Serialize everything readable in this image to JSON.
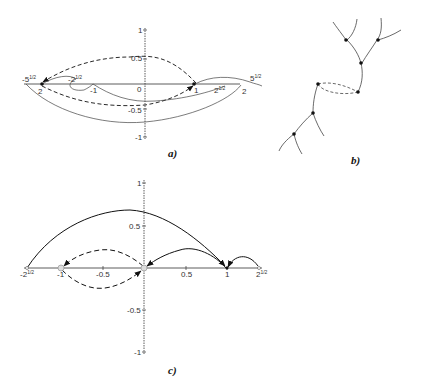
{
  "panels": {
    "a": {
      "caption": "a)",
      "x_ticks": [
        {
          "label": "-5",
          "exp": "1/2",
          "x": -2.236
        },
        {
          "label": "-2",
          "exp": "",
          "x": -2
        },
        {
          "label": "-2",
          "exp": "1/2",
          "x": -1.414
        },
        {
          "label": "-1",
          "exp": "",
          "x": -1
        },
        {
          "label": "0",
          "exp": "",
          "x": 0
        },
        {
          "label": "1",
          "exp": "",
          "x": 1
        },
        {
          "label": "2",
          "exp": "1/2",
          "x": 1.414
        },
        {
          "label": "2",
          "exp": "",
          "x": 2
        },
        {
          "label": "5",
          "exp": "1/2",
          "x": 2.236
        }
      ],
      "y_ticks": [
        "1",
        "0.5",
        "-0.5",
        "-1"
      ]
    },
    "b": {
      "caption": "b)"
    },
    "c": {
      "caption": "c)",
      "x_ticks": [
        {
          "label": "-2",
          "exp": "1/2",
          "x": -1.414
        },
        {
          "label": "-1",
          "exp": "",
          "x": -1
        },
        {
          "label": "-0.5",
          "exp": "",
          "x": -0.5
        },
        {
          "label": "0.5",
          "exp": "",
          "x": 0.5
        },
        {
          "label": "1",
          "exp": "",
          "x": 1
        },
        {
          "label": "2",
          "exp": "1/2",
          "x": 1.414
        }
      ],
      "y_ticks": [
        "1",
        "0.5",
        "-0.5",
        "-1"
      ]
    }
  },
  "labels": {
    "a_neg_sqrt5": "-5",
    "a_neg_sqrt5_exp": "1/2",
    "a_neg2": "2",
    "a_neg_sqrt2": "-2",
    "a_neg_sqrt2_exp": "1/2",
    "a_neg1": "-1",
    "a_zero": "0",
    "a_one": "1",
    "a_sqrt2": "2",
    "a_sqrt2_exp": "1/2",
    "a_two": "2",
    "a_sqrt5": "5",
    "a_sqrt5_exp": "1/2",
    "a_y1": "1",
    "a_y05": "0.5",
    "a_ym05": "-0.5",
    "a_ym1": "-1",
    "c_neg_sqrt2": "-2",
    "c_neg_sqrt2_exp": "1/2",
    "c_neg1": "-1",
    "c_neg05": "-0.5",
    "c_05": "0.5",
    "c_one": "1",
    "c_sqrt2": "2",
    "c_sqrt2_exp": "1/2",
    "c_y1": "1",
    "c_y05": "0.5",
    "c_ym05": "-0.5",
    "c_ym1": "-1"
  }
}
